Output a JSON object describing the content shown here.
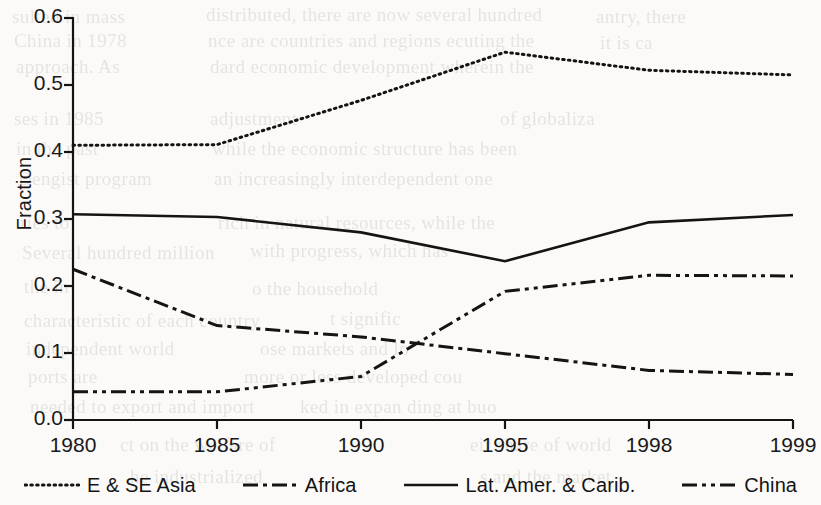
{
  "figure": {
    "background_color": "#fbfaf8",
    "ink_color": "#141414"
  },
  "axis": {
    "ylabel": "Fraction",
    "yticks": [
      "0.0",
      "0.1",
      "0.2",
      "0.3",
      "0.4",
      "0.5",
      "0.6"
    ],
    "xticks": [
      "1980",
      "1985",
      "1990",
      "1995",
      "1998",
      "1999"
    ]
  },
  "legend": {
    "items": [
      {
        "label": "E & SE Asia",
        "dash": "dotted"
      },
      {
        "label": "Africa",
        "dash": "dash-dot"
      },
      {
        "label": "Lat. Amer. & Carib.",
        "dash": "solid"
      },
      {
        "label": "China",
        "dash": "dash-dot-dot"
      }
    ]
  },
  "bleed_text": [
    {
      "x": 12,
      "y": 6,
      "t": "sulted in mass"
    },
    {
      "x": 206,
      "y": 4,
      "t": "distributed, there are now  several hundred"
    },
    {
      "x": 596,
      "y": 6,
      "t": "antry, there"
    },
    {
      "x": 14,
      "y": 30,
      "t": "China in 1978"
    },
    {
      "x": 208,
      "y": 30,
      "t": "nce are  countries and  regions   ecuting  the"
    },
    {
      "x": 600,
      "y": 32,
      "t": "it is ca"
    },
    {
      "x": 16,
      "y": 56,
      "t": "approach. As"
    },
    {
      "x": 210,
      "y": 56,
      "t": "dard  economic  development  wherein   the"
    },
    {
      "x": 14,
      "y": 108,
      "t": "ses in 1985"
    },
    {
      "x": 210,
      "y": 108,
      "t": "adjustment"
    },
    {
      "x": 500,
      "y": 108,
      "t": "of globaliza"
    },
    {
      "x": 16,
      "y": 138,
      "t": "in the past"
    },
    {
      "x": 212,
      "y": 138,
      "t": "while the economic structure has  been"
    },
    {
      "x": 18,
      "y": 168,
      "t": "Dengist  program"
    },
    {
      "x": 214,
      "y": 168,
      "t": "an  increasingly  interdependent   one"
    },
    {
      "x": 20,
      "y": 212,
      "t": "ries to"
    },
    {
      "x": 218,
      "y": 212,
      "t": "rich  in  natural  resources,   while  the"
    },
    {
      "x": 22,
      "y": 242,
      "t": "Several  hundred million"
    },
    {
      "x": 250,
      "y": 240,
      "t": "with progress,  which  has"
    },
    {
      "x": 24,
      "y": 276,
      "t": "the  in"
    },
    {
      "x": 252,
      "y": 278,
      "t": "o the  household"
    },
    {
      "x": 24,
      "y": 310,
      "t": "characteristic  of  each  country"
    },
    {
      "x": 330,
      "y": 308,
      "t": "t   signific"
    },
    {
      "x": 26,
      "y": 338,
      "t": "independent  world"
    },
    {
      "x": 260,
      "y": 338,
      "t": "ose   markets   and   lo"
    },
    {
      "x": 28,
      "y": 366,
      "t": "ports  are"
    },
    {
      "x": 244,
      "y": 366,
      "t": "more   or   less   developed   cou"
    },
    {
      "x": 30,
      "y": 396,
      "t": "needed  to  export  and  import"
    },
    {
      "x": 300,
      "y": 396,
      "t": "ked  in  expan   ding   at   buo"
    },
    {
      "x": 120,
      "y": 434,
      "t": "ct  on  the  welfare  of"
    },
    {
      "x": 470,
      "y": 434,
      "t": "eir   share   of   world"
    },
    {
      "x": 130,
      "y": 466,
      "t": "he  industrialized"
    },
    {
      "x": 480,
      "y": 466,
      "t": "s  and  the  market"
    }
  ],
  "chart_data": {
    "type": "line",
    "title": "",
    "xlabel": "",
    "ylabel": "Fraction",
    "categories": [
      "1980",
      "1985",
      "1990",
      "1995",
      "1998",
      "1999"
    ],
    "ylim": [
      0.0,
      0.6
    ],
    "ytick_step": 0.1,
    "grid": false,
    "legend_position": "bottom",
    "x_spacing": "categorical-equal",
    "series": [
      {
        "name": "E & SE Asia",
        "dash": "dotted",
        "values": [
          0.41,
          0.411,
          0.477,
          0.549,
          0.522,
          0.515
        ]
      },
      {
        "name": "Africa",
        "dash": "dash-dot",
        "values": [
          0.225,
          0.141,
          0.124,
          0.099,
          0.074,
          0.068
        ]
      },
      {
        "name": "Lat. Amer. & Carib.",
        "dash": "solid",
        "values": [
          0.307,
          0.303,
          0.28,
          0.237,
          0.295,
          0.306
        ]
      },
      {
        "name": "China",
        "dash": "dash-dot-dot",
        "values": [
          0.042,
          0.042,
          0.065,
          0.192,
          0.216,
          0.215
        ]
      }
    ]
  }
}
